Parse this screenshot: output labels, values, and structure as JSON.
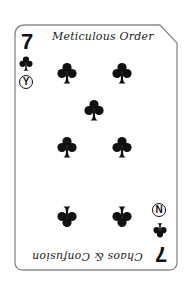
{
  "card": {
    "rank": "7",
    "suit": "clubs",
    "suit_icon": "club-icon",
    "top_label": "Meticulous Order",
    "bottom_label": "Chaos & Confusion",
    "top_badge": "Y",
    "bottom_badge": "N",
    "pip_count": 7,
    "colors": {
      "ink": "#111111",
      "border": "#8a8a8a",
      "background": "#ffffff"
    }
  }
}
